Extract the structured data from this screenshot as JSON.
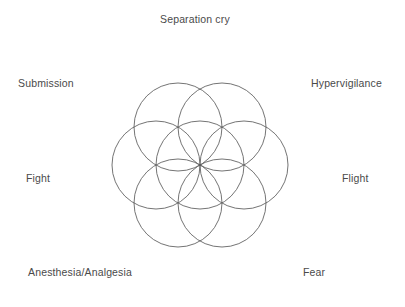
{
  "figure": {
    "title": "",
    "background_color": "#ffffff",
    "text_color": "#4a4a4a",
    "stroke_color": "#5b5b5b"
  },
  "labels": {
    "top": "Separation cry",
    "top_left": "Submission",
    "top_right": "Hypervigilance",
    "left": "Fight",
    "right": "Flight",
    "bottom_left": "Anesthesia/Analgesia",
    "bottom_right": "Fear"
  },
  "chart_data": {
    "type": "diagram",
    "subtype": "overlapping-circles-venn",
    "title": "",
    "xlabel": "",
    "ylabel": "",
    "categories": [
      "Separation cry",
      "Hypervigilance",
      "Flight",
      "Fear",
      "Anesthesia/Analgesia",
      "Fight",
      "Submission"
    ],
    "values": [
      1,
      1,
      1,
      1,
      1,
      1,
      1
    ],
    "circle_count": 7,
    "circle_radius": 44,
    "center": [
      200,
      165
    ],
    "circles": [
      {
        "name": "center",
        "cx": 200,
        "cy": 165,
        "r": 44,
        "faint": false
      },
      {
        "name": "upper-left",
        "cx": 178,
        "cy": 127,
        "r": 44,
        "faint": false
      },
      {
        "name": "upper-right",
        "cx": 222,
        "cy": 127,
        "r": 44,
        "faint": false
      },
      {
        "name": "right",
        "cx": 244,
        "cy": 165,
        "r": 44,
        "faint": false
      },
      {
        "name": "lower-right",
        "cx": 222,
        "cy": 203,
        "r": 44,
        "faint": false
      },
      {
        "name": "lower-left",
        "cx": 178,
        "cy": 203,
        "r": 44,
        "faint": false
      },
      {
        "name": "left",
        "cx": 156,
        "cy": 165,
        "r": 44,
        "faint": false
      }
    ],
    "legend": [],
    "grid": false
  }
}
